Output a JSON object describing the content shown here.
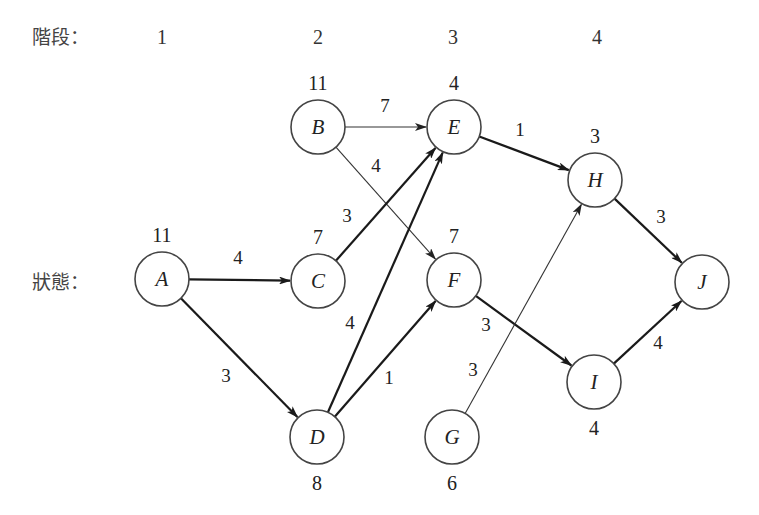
{
  "labels": {
    "stage_label": "階段：",
    "state_label": "狀態："
  },
  "stages": [
    {
      "label": "1",
      "x": 162
    },
    {
      "label": "2",
      "x": 318
    },
    {
      "label": "3",
      "x": 453
    },
    {
      "label": "4",
      "x": 597
    }
  ],
  "nodes": [
    {
      "id": "A",
      "x": 162,
      "y": 279,
      "value": "11",
      "value_pos": "above"
    },
    {
      "id": "B",
      "x": 318,
      "y": 127,
      "value": "11",
      "value_pos": "above"
    },
    {
      "id": "C",
      "x": 318,
      "y": 281,
      "value": "7",
      "value_pos": "above"
    },
    {
      "id": "D",
      "x": 317,
      "y": 437,
      "value": "8",
      "value_pos": "below"
    },
    {
      "id": "E",
      "x": 454,
      "y": 127,
      "value": "4",
      "value_pos": "above"
    },
    {
      "id": "F",
      "x": 454,
      "y": 280,
      "value": "7",
      "value_pos": "above"
    },
    {
      "id": "G",
      "x": 452,
      "y": 437,
      "value": "6",
      "value_pos": "below"
    },
    {
      "id": "H",
      "x": 595,
      "y": 180,
      "value": "3",
      "value_pos": "above"
    },
    {
      "id": "I",
      "x": 594,
      "y": 382,
      "value": "4",
      "value_pos": "below"
    },
    {
      "id": "J",
      "x": 702,
      "y": 282,
      "value": "",
      "value_pos": "above"
    }
  ],
  "edges": [
    {
      "from": "A",
      "to": "C",
      "weight": "4",
      "style": "thick",
      "lx": 238,
      "ly": 264
    },
    {
      "from": "A",
      "to": "D",
      "weight": "3",
      "style": "thick",
      "lx": 226,
      "ly": 382
    },
    {
      "from": "B",
      "to": "E",
      "weight": "7",
      "style": "thin",
      "lx": 385,
      "ly": 112
    },
    {
      "from": "B",
      "to": "F",
      "weight": "4",
      "style": "thin",
      "lx": 376,
      "ly": 172
    },
    {
      "from": "C",
      "to": "E",
      "weight": "3",
      "style": "thick",
      "lx": 347,
      "ly": 222
    },
    {
      "from": "D",
      "to": "E",
      "weight": "4",
      "style": "thick",
      "lx": 350,
      "ly": 329
    },
    {
      "from": "D",
      "to": "F",
      "weight": "1",
      "style": "thick",
      "lx": 389,
      "ly": 384
    },
    {
      "from": "E",
      "to": "H",
      "weight": "1",
      "style": "thick",
      "lx": 520,
      "ly": 136
    },
    {
      "from": "F",
      "to": "I",
      "weight": "3",
      "style": "thick",
      "lx": 486,
      "ly": 331
    },
    {
      "from": "G",
      "to": "H",
      "weight": "3",
      "style": "thin",
      "lx": 473,
      "ly": 376
    },
    {
      "from": "H",
      "to": "J",
      "weight": "3",
      "style": "thick",
      "lx": 661,
      "ly": 223
    },
    {
      "from": "I",
      "to": "J",
      "weight": "4",
      "style": "thick",
      "lx": 658,
      "ly": 349
    }
  ],
  "node_radius": 27
}
